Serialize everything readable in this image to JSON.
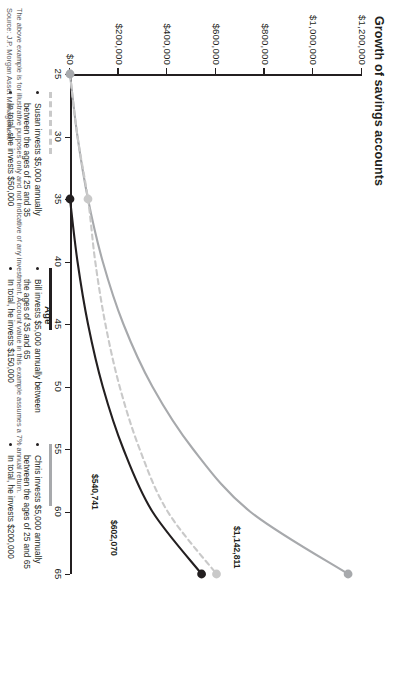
{
  "chart_data": {
    "type": "line",
    "title": "Growth of savings accounts",
    "xlabel": "Age",
    "ylabel": "",
    "xlim": [
      25,
      65
    ],
    "ylim": [
      0,
      1200000
    ],
    "xticks": [
      "25",
      "30",
      "35",
      "40",
      "45",
      "50",
      "55",
      "60",
      "65"
    ],
    "yticks": [
      "$0",
      "$200,000",
      "$400,000",
      "$600,000",
      "$800,000",
      "$1,000,000",
      "$1,200,000"
    ],
    "grid": false,
    "legend_position": "below",
    "series": [
      {
        "name": "Susan",
        "style": "dashed",
        "color": "#c9c9c9",
        "x": [
          25,
          30,
          35,
          40,
          45,
          50,
          55,
          60,
          65
        ],
        "values": [
          0,
          30766,
          73918,
          103680,
          145424,
          203957,
          286063,
          401235,
          602070
        ],
        "end_label": "$602,070",
        "end_value": 602070
      },
      {
        "name": "Bill",
        "style": "solid",
        "color": "#231f20",
        "x": [
          25,
          30,
          35,
          40,
          45,
          50,
          55,
          60,
          65
        ],
        "values": [
          0,
          0,
          0,
          30766,
          73918,
          134440,
          219326,
          338384,
          540741
        ],
        "end_label": "$540,741",
        "end_value": 540741
      },
      {
        "name": "Chris",
        "style": "solid",
        "color": "#a7a9ac",
        "x": [
          25,
          30,
          35,
          40,
          45,
          50,
          55,
          60,
          65
        ],
        "values": [
          0,
          30766,
          73918,
          134440,
          219326,
          338384,
          505365,
          739567,
          1142811
        ],
        "end_label": "$1,142,811",
        "end_value": 1142811
      }
    ],
    "markers": [
      {
        "series": "Susan",
        "x": 25,
        "y": 0,
        "color": "#c9c9c9"
      },
      {
        "series": "Susan",
        "x": 35,
        "y": 73918,
        "color": "#c9c9c9"
      },
      {
        "series": "Bill",
        "x": 35,
        "y": 0,
        "color": "#231f20"
      },
      {
        "series": "Chris",
        "x": 25,
        "y": 0,
        "color": "#a7a9ac"
      }
    ]
  },
  "legend": {
    "susan": {
      "swatch": "dashed-light-gray",
      "bullets": [
        "Susan invests $5,000 annually between the ages of 25 and 35",
        "In total, she invests $50,000"
      ]
    },
    "bill": {
      "swatch": "solid-black",
      "bullets": [
        "Bill invests $5,000 annually between the ages of 35 and 65",
        "In total, he invests $150,000"
      ]
    },
    "chris": {
      "swatch": "solid-gray",
      "bullets": [
        "Chris invests $5,000 annually between the ages of 25 and 65",
        "In total, he invests $200,000"
      ]
    }
  },
  "footer": {
    "disclaimer": "The above example is for illustrative purposes only and not indicative of any investment. Account value in this example assumes a 7% annual return.",
    "source": "Source: J.P. Morgan Asset Management"
  },
  "colors": {
    "ink": "#231f20",
    "susan": "#c9c9c9",
    "bill": "#231f20",
    "chris": "#a7a9ac"
  }
}
